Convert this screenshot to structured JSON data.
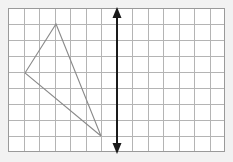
{
  "figure": {
    "canvas": {
      "width": 233,
      "height": 162,
      "background": "#f2f2f2"
    },
    "grid": {
      "name": "coordinate-grid",
      "x": 8,
      "y": 8,
      "width": 217,
      "height": 144,
      "columns": 14,
      "rows": 9,
      "cell_width": 15.5,
      "cell_height": 16,
      "line_color": "#b4b4b4",
      "border_color": "#9a9a9a",
      "fill_color": "#ffffff",
      "line_width": 1
    },
    "triangle": {
      "name": "triangle-shape",
      "stroke_color": "#8a8a8a",
      "stroke_width": 1,
      "fill": "none",
      "vertices": [
        {
          "label": "left-vertex",
          "x": 25,
          "y": 73
        },
        {
          "label": "top-vertex",
          "x": 56,
          "y": 24
        },
        {
          "label": "bottom-vertex",
          "x": 101,
          "y": 136
        }
      ],
      "points": "25,73 56,24 101,136"
    },
    "arrow": {
      "name": "vertical-double-arrow",
      "color": "#1a1a1a",
      "stroke_width": 2,
      "x": 117,
      "y_top": 9,
      "y_bottom": 152,
      "head_width": 9,
      "head_length": 11,
      "double_headed": true,
      "orientation": "vertical"
    }
  }
}
